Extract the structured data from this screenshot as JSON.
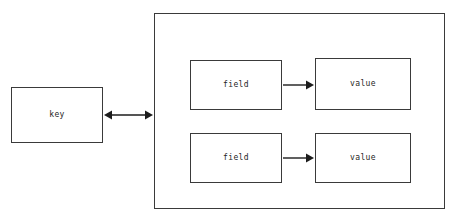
{
  "diagram": {
    "type": "entity-relationship",
    "key_node": {
      "label": "key",
      "x": 11,
      "y": 87,
      "width": 92,
      "height": 56
    },
    "container": {
      "name": "value-container",
      "x": 154,
      "y": 13,
      "width": 291,
      "height": 196
    },
    "rows": [
      {
        "field": {
          "label": "field",
          "x": 190,
          "y": 60,
          "width": 92,
          "height": 50
        },
        "value": {
          "label": "value",
          "x": 315,
          "y": 58,
          "width": 96,
          "height": 52
        },
        "arrow": {
          "name": "field-to-value-arrow",
          "direction": "right",
          "x1": 283,
          "y1": 85,
          "x2": 314,
          "y2": 85
        }
      },
      {
        "field": {
          "label": "field",
          "x": 190,
          "y": 133,
          "width": 92,
          "height": 50
        },
        "value": {
          "label": "value",
          "x": 315,
          "y": 133,
          "width": 96,
          "height": 50
        },
        "arrow": {
          "name": "field-to-value-arrow",
          "direction": "right",
          "x1": 283,
          "y1": 158,
          "x2": 314,
          "y2": 158
        }
      }
    ],
    "key_connector": {
      "name": "key-to-container-arrow",
      "direction": "bidirectional",
      "x1": 104,
      "y1": 115,
      "x2": 153,
      "y2": 115
    }
  }
}
